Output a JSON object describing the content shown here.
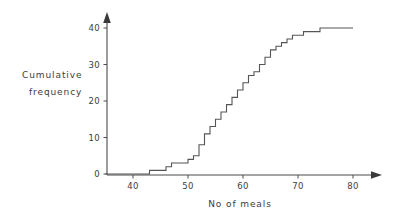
{
  "chart_data": {
    "type": "line",
    "subtype": "cumulative-frequency-step",
    "title": "",
    "xlabel": "No  of  meals",
    "ylabel": "Cumulative frequency",
    "ylabel_line1": "Cumulative",
    "ylabel_line2": "frequency",
    "xlim": [
      35,
      82
    ],
    "ylim": [
      0,
      42
    ],
    "xticks": [
      40,
      50,
      60,
      70,
      80
    ],
    "xtick_labels": [
      "40",
      "50",
      "60",
      "70",
      "80"
    ],
    "yticks": [
      0,
      10,
      20,
      30,
      40
    ],
    "ytick_labels": [
      "0",
      "10",
      "20",
      "30",
      "40"
    ],
    "grid": false,
    "legend": false,
    "axis_arrows": true,
    "series": [
      {
        "name": "Cumulative frequency",
        "color": "#555555",
        "step_type": "post",
        "x": [
          35,
          42,
          43,
          45,
          46,
          47,
          50,
          51,
          52,
          53,
          54,
          55,
          56,
          57,
          58,
          59,
          60,
          61,
          62,
          63,
          64,
          65,
          66,
          67,
          68,
          69,
          70,
          71,
          72,
          73,
          74,
          80
        ],
        "y": [
          0,
          0,
          1,
          1,
          2,
          3,
          4,
          5,
          8,
          11,
          13,
          15,
          17,
          19,
          21,
          23,
          25,
          27,
          28,
          30,
          32,
          34,
          35,
          36,
          37,
          38,
          38,
          39,
          39,
          39,
          40,
          40
        ]
      }
    ],
    "annotations": []
  },
  "colors": {
    "axis": "#4a4a4a",
    "curve": "#555555",
    "text": "#3d3d3d",
    "background": "#ffffff"
  }
}
